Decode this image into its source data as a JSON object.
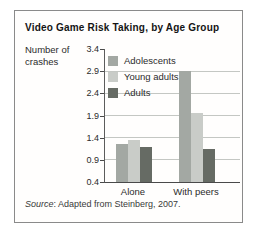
{
  "figure": {
    "title": "Video Game Risk Taking, by Age Group",
    "y_axis_label_line1": "Number of",
    "y_axis_label_line2": "crashes",
    "source_prefix": "Source",
    "source_rest": ": Adapted from Steinberg, 2007."
  },
  "chart_data": {
    "type": "bar",
    "title": "Video Game Risk Taking, by Age Group",
    "xlabel": "",
    "ylabel": "Number of crashes",
    "categories": [
      "Alone",
      "With peers"
    ],
    "series": [
      {
        "name": "Adolescents",
        "color": "#a3a8a3",
        "values": [
          1.25,
          2.9
        ]
      },
      {
        "name": "Young adults",
        "color": "#c9ccc8",
        "values": [
          1.35,
          1.95
        ]
      },
      {
        "name": "Adults",
        "color": "#666b64",
        "values": [
          1.2,
          1.15
        ]
      }
    ],
    "ylim": [
      0.4,
      3.4
    ],
    "yticks": [
      0.4,
      0.9,
      1.4,
      1.9,
      2.4,
      2.9,
      3.4
    ],
    "grid": true,
    "legend_position": "top-left",
    "source": "Source: Adapted from Steinberg, 2007.",
    "colors": {
      "gridline": "#c4c7c3",
      "axis": "#4a4a4a",
      "border": "#8a8a8a"
    }
  }
}
